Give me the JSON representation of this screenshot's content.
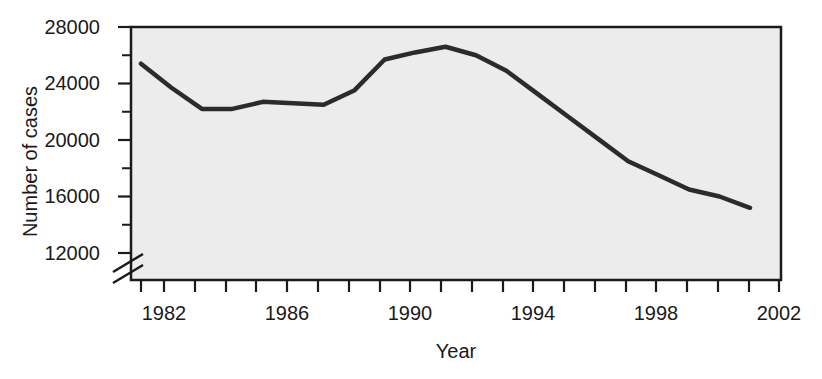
{
  "chart_data": {
    "type": "line",
    "title": "",
    "xlabel": "Year",
    "ylabel": "Number of cases",
    "xlim": [
      1981,
      2002
    ],
    "ylim": [
      11000,
      28000
    ],
    "grid": false,
    "legend": null,
    "axis_break": {
      "axis": "y",
      "below": 12000,
      "symbol": "double-slash"
    },
    "y_ticks_major": [
      12000,
      16000,
      20000,
      24000,
      28000
    ],
    "y_ticks_minor": [
      14000,
      18000,
      22000,
      26000
    ],
    "y_tick_labels": [
      "12000",
      "16000",
      "20000",
      "24000",
      "28000"
    ],
    "x_ticks_major": [
      1982,
      1986,
      1990,
      1994,
      1998,
      2002
    ],
    "x_ticks_minor": [
      1983,
      1984,
      1985,
      1987,
      1988,
      1989,
      1991,
      1992,
      1993,
      1995,
      1996,
      1997,
      1999,
      2000,
      2001
    ],
    "x_tick_labels": [
      "1982",
      "1986",
      "1990",
      "1994",
      "1998",
      "2002"
    ],
    "series": [
      {
        "name": "Number of cases",
        "color": "#2b2b2b",
        "x": [
          1982,
          1983,
          1984,
          1985,
          1986,
          1987,
          1988,
          1989,
          1990,
          1991,
          1992,
          1993,
          1994,
          1995,
          1996,
          1997,
          1998,
          1999,
          2000,
          2001,
          2002
        ],
        "y": [
          25400,
          23700,
          22200,
          22200,
          22700,
          22600,
          22500,
          23500,
          25700,
          26200,
          26600,
          26000,
          24900,
          23300,
          21700,
          20100,
          18500,
          17500,
          16500,
          16000,
          15200
        ]
      }
    ]
  },
  "plot": {
    "background_color": "#ececec",
    "frame_color": "#1a1a1a",
    "line_color": "#2b2b2b"
  }
}
